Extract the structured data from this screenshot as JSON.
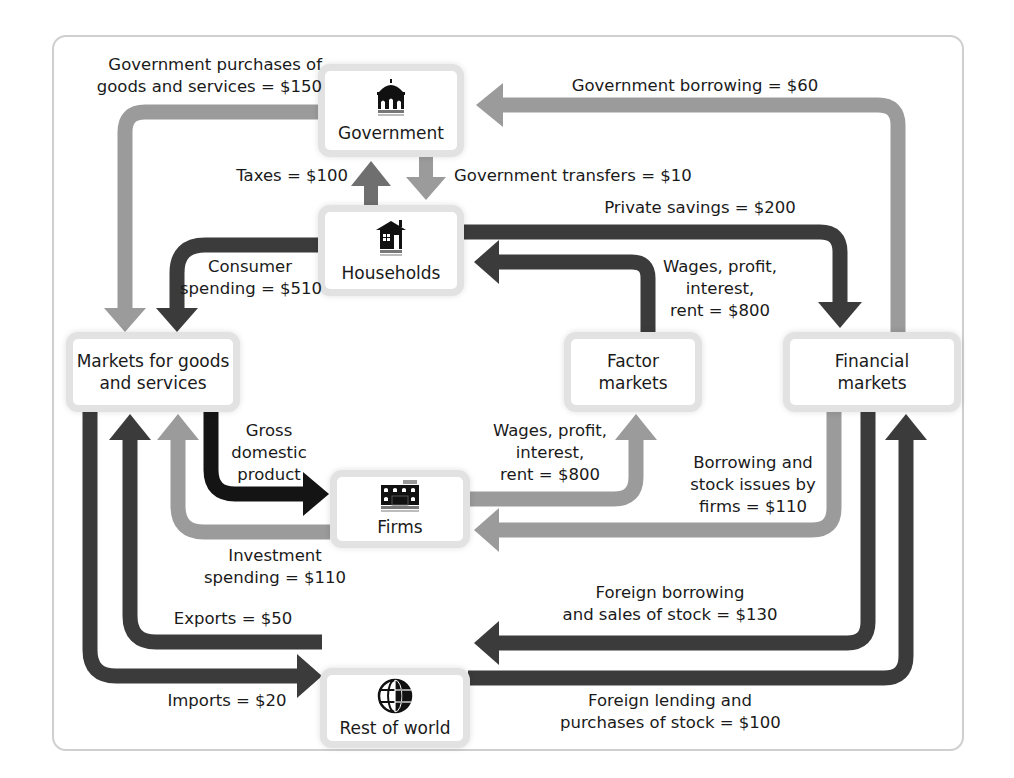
{
  "diagram": {
    "nodes": {
      "government": {
        "label": "Government",
        "icon": "government-building-icon"
      },
      "households": {
        "label": "Households",
        "icon": "house-icon"
      },
      "markets_goods": {
        "label_line1": "Markets for goods",
        "label_line2": "and services"
      },
      "factor_markets": {
        "label_line1": "Factor",
        "label_line2": "markets"
      },
      "financial_markets": {
        "label_line1": "Financial",
        "label_line2": "markets"
      },
      "firms": {
        "label": "Firms",
        "icon": "factory-building-icon"
      },
      "rest_of_world": {
        "label": "Rest of world",
        "icon": "globe-icon"
      }
    },
    "flows": {
      "gov_purchases": {
        "line1": "Government purchases of",
        "line2": "goods and services = $150",
        "value": 150,
        "from": "Government",
        "to": "Markets for goods and services"
      },
      "gov_borrowing": {
        "line1": "Government borrowing = $60",
        "value": 60,
        "from": "Financial markets",
        "to": "Government"
      },
      "taxes": {
        "line1": "Taxes = $100",
        "value": 100,
        "from": "Households",
        "to": "Government"
      },
      "gov_transfers": {
        "line1": "Government transfers = $10",
        "value": 10,
        "from": "Government",
        "to": "Households"
      },
      "private_savings": {
        "line1": "Private savings = $200",
        "value": 200,
        "from": "Households",
        "to": "Financial markets"
      },
      "consumer_spending": {
        "line1": "Consumer",
        "line2": "spending = $510",
        "value": 510,
        "from": "Households",
        "to": "Markets for goods and services"
      },
      "wages_to_households": {
        "line1": "Wages, profit,",
        "line2": "interest,",
        "line3": "rent = $800",
        "value": 800,
        "from": "Factor markets",
        "to": "Households"
      },
      "gdp": {
        "line1": "Gross",
        "line2": "domestic",
        "line3": "product",
        "from": "Markets for goods and services",
        "to": "Firms"
      },
      "wages_from_firms": {
        "line1": "Wages, profit,",
        "line2": "interest,",
        "line3": "rent = $800",
        "value": 800,
        "from": "Firms",
        "to": "Factor markets"
      },
      "firm_borrowing": {
        "line1": "Borrowing and",
        "line2": "stock issues by",
        "line3": "firms = $110",
        "value": 110,
        "from": "Financial markets",
        "to": "Firms"
      },
      "investment_spending": {
        "line1": "Investment",
        "line2": "spending = $110",
        "value": 110,
        "from": "Firms",
        "to": "Markets for goods and services"
      },
      "exports": {
        "line1": "Exports = $50",
        "value": 50,
        "from": "Rest of world",
        "to": "Markets for goods and services"
      },
      "imports": {
        "line1": "Imports = $20",
        "value": 20,
        "from": "Markets for goods and services",
        "to": "Rest of world"
      },
      "foreign_borrowing": {
        "line1": "Foreign borrowing",
        "line2": "and sales of stock = $130",
        "value": 130,
        "from": "Financial markets",
        "to": "Rest of world"
      },
      "foreign_lending": {
        "line1": "Foreign lending and",
        "line2": "purchases of stock = $100",
        "value": 100,
        "from": "Rest of world",
        "to": "Financial markets"
      }
    },
    "colors": {
      "light_arrow": "#9b9b9b",
      "medium_arrow": "#6f6f6f",
      "dark_arrow": "#3b3b3b",
      "black_arrow": "#141414",
      "box_border": "#e2e2e2",
      "frame_border": "#cfcfcf",
      "text": "#1a1a1a"
    }
  }
}
